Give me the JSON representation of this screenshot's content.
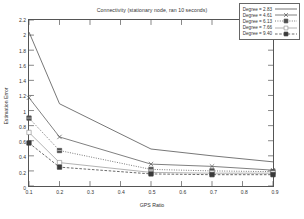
{
  "chart_data": {
    "type": "line",
    "title": "Connectivity (stationary node, ran 10 seconds)",
    "xlabel": "GPS Ratio",
    "ylabel": "Estimation Error",
    "x": [
      0.1,
      0.2,
      0.5,
      0.7,
      0.9
    ],
    "xlim": [
      0.1,
      0.9
    ],
    "ylim": [
      0,
      2.2
    ],
    "xticks": [
      "0.1",
      "0.2",
      "0.3",
      "0.4",
      "0.5",
      "0.6",
      "0.7",
      "0.8",
      "0.9"
    ],
    "yticks": [
      "0",
      "0.2",
      "0.4",
      "0.6",
      "0.8",
      "1",
      "1.2",
      "1.4",
      "1.6",
      "1.8",
      "2",
      "2.2"
    ],
    "grid": false,
    "legend_position": "upper-right",
    "series": [
      {
        "name": "Degree = 2.83",
        "marker": "plus",
        "color": "#4a4a4a",
        "dash": "none",
        "values": [
          2.04,
          1.09,
          0.49,
          0.4,
          0.32
        ]
      },
      {
        "name": "Degree = 4.61",
        "marker": "cross",
        "color": "#555555",
        "dash": "none",
        "values": [
          1.17,
          0.65,
          0.29,
          0.26,
          0.21
        ]
      },
      {
        "name": "Degree = 6.13",
        "marker": "star-square",
        "color": "#4f4f4f",
        "dash": "dotted",
        "values": [
          0.9,
          0.47,
          0.22,
          0.2,
          0.19
        ]
      },
      {
        "name": "Degree = 7.66",
        "marker": "open-square",
        "color": "#9a9a9a",
        "dash": "none",
        "values": [
          0.71,
          0.31,
          0.18,
          0.17,
          0.17
        ]
      },
      {
        "name": "Degree = 9.40",
        "marker": "filled-square",
        "color": "#3a3a3a",
        "dash": "dashed",
        "values": [
          0.57,
          0.25,
          0.16,
          0.15,
          0.15
        ]
      }
    ]
  }
}
